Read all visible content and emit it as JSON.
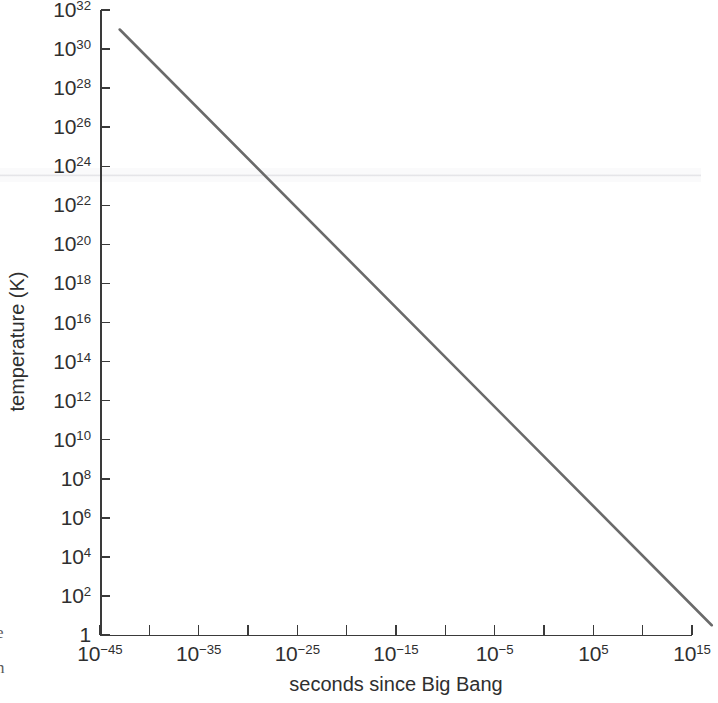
{
  "figure": {
    "background_color": "#ffffff",
    "line_color": "#6a6a6a",
    "axis_color": "#3a3a3a",
    "text_color": "#2f2f2f"
  },
  "chart_data": {
    "type": "line",
    "title": "",
    "xlabel": "seconds since Big Bang",
    "ylabel": "temperature (K)",
    "xscale": "log",
    "yscale": "log",
    "xlim": [
      1e-46,
      1e+19
    ],
    "ylim": [
      1,
      1e+32
    ],
    "grid": false,
    "legend": null,
    "x_tick_labels": [
      "10⁻⁴⁵",
      "10⁻³⁵",
      "10⁻²⁵",
      "10⁻¹⁵",
      "10⁻⁵",
      "10⁵",
      "10¹⁵"
    ],
    "x_tick_exponents": [
      -45,
      -35,
      -25,
      -15,
      -5,
      5,
      15
    ],
    "x_minor_tick_exponents": [
      -40,
      -30,
      -20,
      -10,
      0,
      10,
      20
    ],
    "y_tick_labels": [
      "10³²",
      "10³⁰",
      "10²⁸",
      "10²⁶",
      "10²⁴",
      "10²²",
      "10²⁰",
      "10¹⁸",
      "10¹⁶",
      "10¹⁴",
      "10¹²",
      "10¹⁰",
      "10⁸",
      "10⁶",
      "10⁴",
      "10²",
      "1"
    ],
    "y_tick_exponents": [
      32,
      30,
      28,
      26,
      24,
      22,
      20,
      18,
      16,
      14,
      12,
      10,
      8,
      6,
      4,
      2,
      0
    ],
    "series": [
      {
        "name": "temperature vs time",
        "x": [
          1e-43,
          1e+17
        ],
        "y": [
          1e+31,
          3
        ],
        "points": [
          {
            "x_exp": -43,
            "y_exp": 31
          },
          {
            "x_exp": 17,
            "y_exp": 0.5
          }
        ]
      }
    ],
    "annotations": []
  },
  "y_ticks": [
    {
      "label_base": "10",
      "exp": "32"
    },
    {
      "label_base": "10",
      "exp": "30"
    },
    {
      "label_base": "10",
      "exp": "28"
    },
    {
      "label_base": "10",
      "exp": "26"
    },
    {
      "label_base": "10",
      "exp": "24"
    },
    {
      "label_base": "10",
      "exp": "22"
    },
    {
      "label_base": "10",
      "exp": "20"
    },
    {
      "label_base": "10",
      "exp": "18"
    },
    {
      "label_base": "10",
      "exp": "16"
    },
    {
      "label_base": "10",
      "exp": "14"
    },
    {
      "label_base": "10",
      "exp": "12"
    },
    {
      "label_base": "10",
      "exp": "10"
    },
    {
      "label_base": "10",
      "exp": "8"
    },
    {
      "label_base": "10",
      "exp": "6"
    },
    {
      "label_base": "10",
      "exp": "4"
    },
    {
      "label_base": "10",
      "exp": "2"
    },
    {
      "label_base": "1",
      "exp": ""
    }
  ],
  "x_ticks": [
    {
      "label_base": "10",
      "exp": "−45"
    },
    {
      "label_base": "10",
      "exp": "−35"
    },
    {
      "label_base": "10",
      "exp": "−25"
    },
    {
      "label_base": "10",
      "exp": "−15"
    },
    {
      "label_base": "10",
      "exp": "−5"
    },
    {
      "label_base": "10",
      "exp": "5"
    },
    {
      "label_base": "10",
      "exp": "15"
    }
  ],
  "axis_titles": {
    "x": "seconds since Big Bang",
    "y": "temperature (K)"
  },
  "caption_remnants": [
    "e",
    "n"
  ]
}
